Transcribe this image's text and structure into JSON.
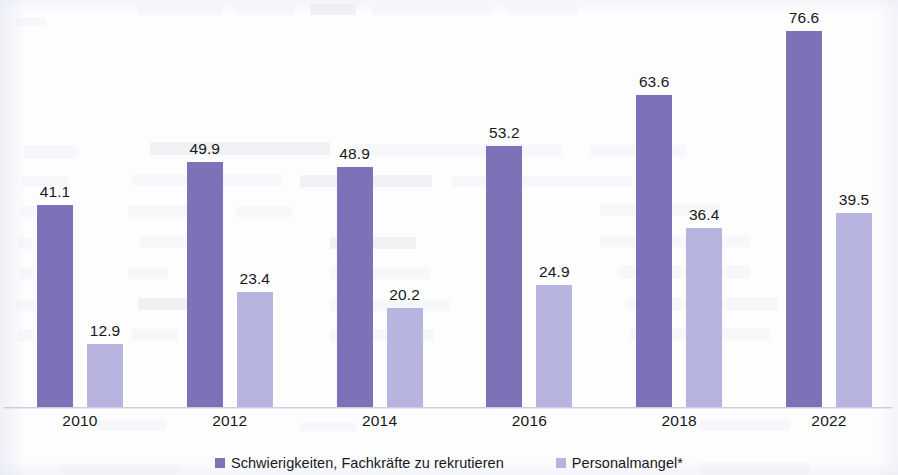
{
  "chart_data": {
    "type": "bar",
    "title": "",
    "subtitle": "",
    "xlabel": "",
    "ylabel": "",
    "grid": false,
    "legend_position": "bottom",
    "axis_visible": {
      "x": true,
      "y": false
    },
    "ylim": [
      0,
      76.6
    ],
    "categories": [
      "2010",
      "2012",
      "2014",
      "2016",
      "2018",
      "2022"
    ],
    "series": [
      {
        "name": "Schwierigkeiten, Fachkräfte zu rekrutieren",
        "color": "#7b72b8",
        "values": [
          41.1,
          49.9,
          48.9,
          53.2,
          63.6,
          76.6
        ],
        "labels": [
          "41.1",
          "49.9",
          "48.9",
          "53.2",
          "63.6",
          "76.6"
        ]
      },
      {
        "name": "Personalmangel*",
        "color": "#b7b4e0",
        "values": [
          12.9,
          23.4,
          20.2,
          24.9,
          36.4,
          39.5
        ],
        "labels": [
          "12.9",
          "23.4",
          "20.2",
          "24.9",
          "36.4",
          "39.5"
        ]
      }
    ]
  },
  "legend": {
    "items": [
      {
        "label": "Schwierigkeiten, Fachkräfte zu rekrutieren",
        "color": "#7b72b8"
      },
      {
        "label": "Personalmangel*",
        "color": "#b7b4e0"
      }
    ]
  },
  "colors": {
    "series_primary": "#7b72b8",
    "series_secondary": "#b7b4e0",
    "text": "#18181b",
    "axis": "#c9cddd",
    "background": "#fdfdfe"
  }
}
